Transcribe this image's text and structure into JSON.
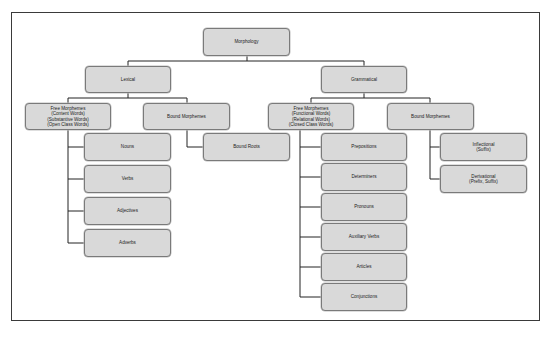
{
  "diagram": {
    "root": {
      "label": "Morphology"
    },
    "branches": {
      "lexical": {
        "label": "Lexical",
        "free": {
          "label": "Free Morphemes\n(Content Words)\n(Substantive Words)\n(Open Class Words)"
        },
        "bound": {
          "label": "Bound Morphemes"
        },
        "free_children": [
          {
            "label": "Nouns"
          },
          {
            "label": "Verbs"
          },
          {
            "label": "Adjectives"
          },
          {
            "label": "Adverbs"
          }
        ],
        "bound_children": [
          {
            "label": "Bound Roots"
          }
        ]
      },
      "grammatical": {
        "label": "Grammatical",
        "free": {
          "label": "Free Morphemes\n(Functional Words)\n(Relational Words)\n(Closed Class Words)"
        },
        "bound": {
          "label": "Bound Morphemes"
        },
        "free_children": [
          {
            "label": "Prepositions"
          },
          {
            "label": "Determiners"
          },
          {
            "label": "Pronouns"
          },
          {
            "label": "Auxiliary Verbs"
          },
          {
            "label": "Articles"
          },
          {
            "label": "Conjunctions"
          }
        ],
        "bound_children": [
          {
            "label": "Inflectional\n(Suffix)"
          },
          {
            "label": "Derivational\n(Prefix, Suffix)"
          }
        ]
      }
    },
    "colors": {
      "node_fill": "#d9d9d9",
      "node_border": "#7a7a7a",
      "connector": "#222222",
      "frame": "#3a3a3a"
    }
  }
}
